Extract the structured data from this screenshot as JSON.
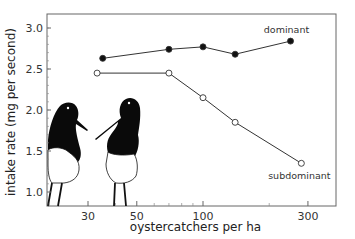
{
  "chart_data": {
    "type": "line",
    "title": "",
    "xlabel": "oystercatchers per ha",
    "ylabel": "intake rate (mg per second)",
    "xscale": "log",
    "xlim": [
      20,
      370
    ],
    "ylim": [
      0.85,
      3.2
    ],
    "xticks": [
      30,
      50,
      100,
      300
    ],
    "xtick_labels": [
      "30",
      "50",
      "100",
      "300"
    ],
    "yticks": [
      1.0,
      1.5,
      2.0,
      2.5,
      3.0
    ],
    "ytick_labels": [
      "1.0",
      "1.5",
      "2.0",
      "2.5",
      "3.0"
    ],
    "grid": false,
    "legend": "inline labels",
    "series": [
      {
        "name": "dominant",
        "marker": "filled-circle",
        "x": [
          35,
          70,
          100,
          140,
          250
        ],
        "values": [
          2.63,
          2.74,
          2.77,
          2.68,
          2.84
        ]
      },
      {
        "name": "subdominant",
        "marker": "open-circle",
        "x": [
          33,
          70,
          100,
          140,
          280
        ],
        "values": [
          2.45,
          2.45,
          2.15,
          1.85,
          1.35
        ]
      }
    ],
    "annotations": [
      "illustration of two oystercatchers facing each other"
    ]
  },
  "colors": {
    "line": "#333333",
    "axis": "#555555",
    "bird_black": "#0a0a0a",
    "bird_white": "#ffffff"
  }
}
